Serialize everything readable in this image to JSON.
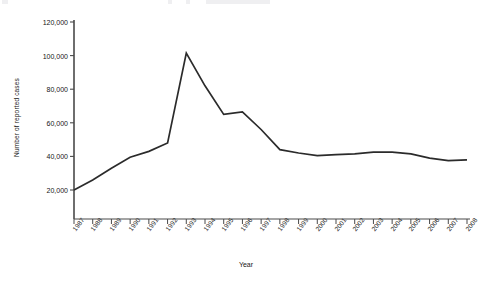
{
  "chart_data": {
    "type": "line",
    "title": "",
    "xlabel": "Year",
    "ylabel": "Number of reported cases",
    "categories": [
      "1987",
      "1988",
      "1989",
      "1990",
      "1991",
      "1992",
      "1993",
      "1994",
      "1995",
      "1996",
      "1997",
      "1998",
      "1999",
      "2000",
      "2001",
      "2002",
      "2003",
      "2004",
      "2005",
      "2006",
      "2007",
      "2008"
    ],
    "values": [
      20000,
      26000,
      33000,
      39500,
      43000,
      48000,
      101500,
      82000,
      65000,
      66500,
      56000,
      44000,
      42000,
      40500,
      41000,
      41500,
      42500,
      42500,
      41500,
      39000,
      37500,
      38000
    ],
    "series": [
      {
        "name": "Number of reported cases",
        "values": [
          20000,
          26000,
          33000,
          39500,
          43000,
          48000,
          101500,
          82000,
          65000,
          66500,
          56000,
          44000,
          42000,
          40500,
          41000,
          41500,
          42500,
          42500,
          41500,
          39000,
          37500,
          38000
        ]
      }
    ],
    "ylim": [
      0,
      120000
    ],
    "yticks": [
      20000,
      40000,
      60000,
      80000,
      100000,
      120000
    ],
    "ytick_labels": [
      "20,000",
      "40,000",
      "60,000",
      "80,000",
      "100,000",
      "120,000"
    ],
    "grid": false,
    "legend": "none",
    "line_color": "#2b2b2b",
    "axis_color": "#4a4a4a"
  }
}
